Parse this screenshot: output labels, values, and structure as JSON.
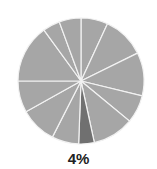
{
  "chart_data": {
    "type": "pie",
    "title": "",
    "start_angle_deg": 0,
    "direction": "clockwise",
    "slices": [
      {
        "value": 6.9,
        "highlight": false
      },
      {
        "value": 10.8,
        "highlight": false
      },
      {
        "value": 11.1,
        "highlight": false
      },
      {
        "value": 7.2,
        "highlight": false
      },
      {
        "value": 10.6,
        "highlight": false
      },
      {
        "value": 4.0,
        "highlight": true,
        "label": "4%"
      },
      {
        "value": 6.9,
        "highlight": false
      },
      {
        "value": 9.4,
        "highlight": false
      },
      {
        "value": 8.1,
        "highlight": false
      },
      {
        "value": 15.0,
        "highlight": false
      },
      {
        "value": 4.4,
        "highlight": false
      },
      {
        "value": 5.6,
        "highlight": false
      }
    ],
    "colors": {
      "default": "#a6a6a6",
      "highlight": "#707070",
      "separator": "#f2f2f2"
    },
    "legend": "none",
    "annotations": [
      "4%"
    ]
  },
  "label": "4%"
}
